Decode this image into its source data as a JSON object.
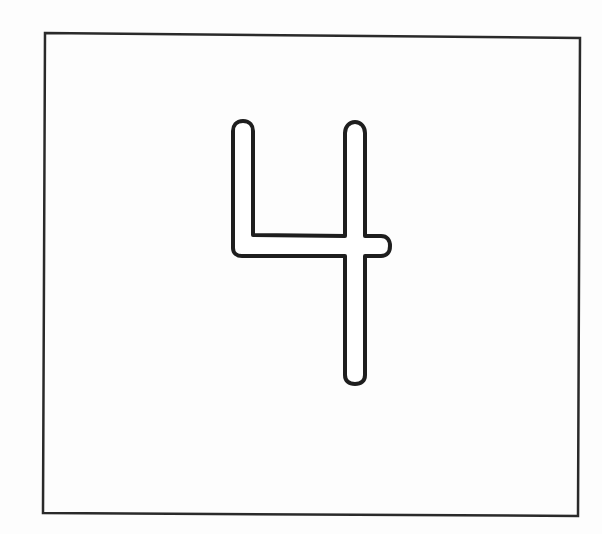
{
  "figure": {
    "label": "4",
    "colors": {
      "background": "#fdfdfd",
      "frame_stroke": "#2a2a2a",
      "glyph_stroke": "#1e1e1e",
      "glyph_fill": "#ffffff"
    },
    "frame": {
      "points": "45,33 580,38 578,516 43,513",
      "stroke_width": 2.5
    },
    "glyph": {
      "stroke_width": 4,
      "outline_path": "M 243 121 C 236 121 233 126 233 131 L 233 248 C 233 253 237 256 242 256 L 345 256 L 345 375 C 345 381 349 384 355 384 C 361 384 365 381 365 375 L 365 256 L 381 256 C 387 256 390 252 390 246 C 390 240 387 236 381 236 L 365 236 L 365 133 C 365 127 361 122 355 122 C 349 122 345 127 345 133 L 345 236 L 253 235 L 253 131 C 253 126 250 121 243 121 Z"
    }
  }
}
